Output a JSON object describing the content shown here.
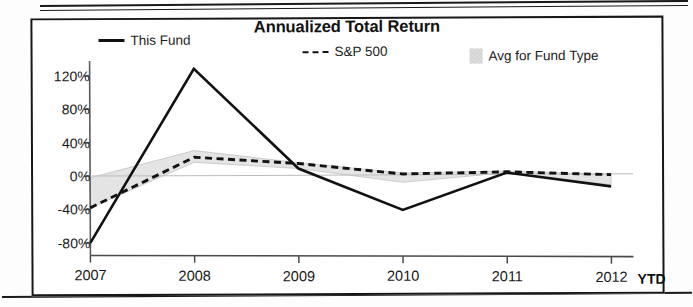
{
  "chart_data": {
    "type": "line",
    "title": "Annualized Total Return",
    "xlabel": "",
    "ylabel": "",
    "x": [
      "2007",
      "2008",
      "2009",
      "2010",
      "2011",
      "2012"
    ],
    "categories": [
      "2007",
      "2008",
      "2009",
      "2010",
      "2011",
      "2012"
    ],
    "x_axis_suffix": "YTD",
    "ytick_labels": [
      "120%",
      "80%",
      "40%",
      "0%",
      "-40%",
      "-80%"
    ],
    "ytick_values": [
      120,
      80,
      40,
      0,
      -40,
      -80
    ],
    "ylim": [
      -95,
      140
    ],
    "grid": false,
    "legend_position": "top",
    "series": [
      {
        "name": "This Fund",
        "style": "solid",
        "color": "#121212",
        "values": [
          -80,
          128,
          8,
          -42,
          2,
          -15
        ]
      },
      {
        "name": "S&P 500",
        "style": "dashed",
        "color": "#121212",
        "values": [
          -38,
          22,
          14,
          1,
          3,
          -1
        ]
      },
      {
        "name": "Avg for Fund Type",
        "style": "band",
        "color": "#d9d9d9",
        "upper": [
          -2,
          30,
          15,
          2,
          4,
          -1
        ],
        "lower": [
          -38,
          16,
          8,
          -9,
          2,
          -13
        ]
      }
    ]
  },
  "legend": {
    "items": [
      {
        "label": "This Fund",
        "swatch": "solid-line-swatch"
      },
      {
        "label": "S&P 500",
        "swatch": "dashed-line-swatch"
      },
      {
        "label": "Avg for Fund Type",
        "swatch": "shaded-area-swatch"
      }
    ]
  },
  "colors": {
    "line": "#121212",
    "band_fill": "#d9d9d9",
    "frame": "#171717",
    "text": "#191919"
  }
}
